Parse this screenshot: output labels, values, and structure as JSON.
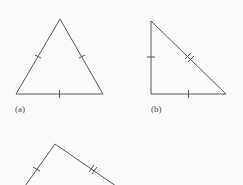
{
  "figure": {
    "triangles": [
      {
        "id": "a",
        "label": "(a)",
        "vertices": [
          [
            60,
            19
          ],
          [
            16,
            94
          ],
          [
            103,
            94
          ]
        ],
        "ticks": {
          "left_side": 1,
          "right_side": 1,
          "base": 1
        }
      },
      {
        "id": "b",
        "label": "(b)",
        "vertices": [
          [
            151,
            21
          ],
          [
            151,
            94
          ],
          [
            226,
            94
          ]
        ],
        "ticks": {
          "vertical_leg": 1,
          "horizontal_leg": 1,
          "hypotenuse": 2
        }
      },
      {
        "id": "c",
        "label": "",
        "vertices": [
          [
            55,
            144
          ],
          [
            25,
            185
          ],
          [
            115,
            185
          ]
        ],
        "ticks": {
          "left_side": 1,
          "right_side": 2
        },
        "clipped": true
      }
    ],
    "stroke_color": "#555555"
  }
}
